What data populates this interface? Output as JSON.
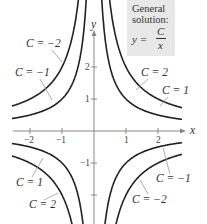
{
  "infobox": {
    "line1": "General",
    "line2": "solution:",
    "eq_lhs": "y =",
    "eq_num": "C",
    "eq_den": "x"
  },
  "chart_data": {
    "type": "line",
    "xlabel": "x",
    "ylabel": "y",
    "xlim": [
      -2.5,
      2.8
    ],
    "ylim": [
      -2.8,
      4.1
    ],
    "x_ticks": [
      -2,
      -1,
      1,
      2
    ],
    "y_ticks": [
      -2,
      -1,
      1,
      2
    ],
    "x_tick_labels": [
      "-2",
      "-1",
      "1",
      "2"
    ],
    "y_tick_labels": [
      "-1",
      "1",
      "2"
    ],
    "grid": false,
    "series": [
      {
        "name": "C = 1",
        "C": 1
      },
      {
        "name": "C = 2",
        "C": 2
      },
      {
        "name": "C = -1",
        "C": -1
      },
      {
        "name": "C = -2",
        "C": -2
      }
    ],
    "annotations": [
      {
        "text": "C = −2",
        "quadrant": "II"
      },
      {
        "text": "C = −1",
        "quadrant": "II"
      },
      {
        "text": "C = 2",
        "quadrant": "I"
      },
      {
        "text": "C = 1",
        "quadrant": "I"
      },
      {
        "text": "C = 1",
        "quadrant": "III"
      },
      {
        "text": "C = 2",
        "quadrant": "III"
      },
      {
        "text": "C = −1",
        "quadrant": "IV"
      },
      {
        "text": "C = −2",
        "quadrant": "IV"
      }
    ]
  }
}
